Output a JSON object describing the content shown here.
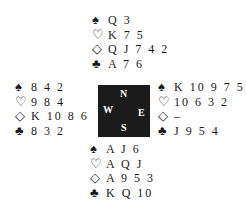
{
  "suits": {
    "spades": "♠",
    "hearts": "♡",
    "diamonds": "◇",
    "clubs": "♣"
  },
  "compass": {
    "north": "N",
    "south": "S",
    "west": "W",
    "east": "E"
  },
  "hands": {
    "north": {
      "spades": "Q 3",
      "hearts": "K 7 5",
      "diamonds": "Q J 7 4 2",
      "clubs": "A 7 6"
    },
    "west": {
      "spades": "8 4 2",
      "hearts": "9 8 4",
      "diamonds": "K 10 8 6",
      "clubs": "8 3 2"
    },
    "east": {
      "spades": "K 10 9 7 5",
      "hearts": "10 6 3 2",
      "diamonds": "–",
      "clubs": "J 9 5 4"
    },
    "south": {
      "spades": "A J 6",
      "hearts": "A Q J",
      "diamonds": "A 9 5 3",
      "clubs": "K Q 10"
    }
  }
}
